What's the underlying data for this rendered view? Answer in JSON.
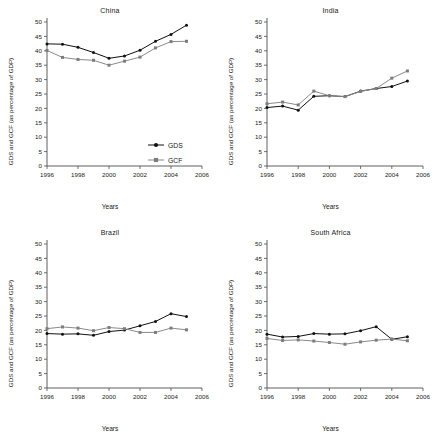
{
  "figure": {
    "axis_label_y": "GDS and GCF (as percentage of GDP)",
    "axis_label_x": "Years",
    "legend": {
      "gds": "GDS",
      "gcf": "GCF"
    },
    "colors": {
      "gds": "#111111",
      "gcf": "#8a8a8a",
      "axis": "#4d4d4d",
      "background": "#ffffff"
    }
  },
  "panels": {
    "china": {
      "title": "China"
    },
    "india": {
      "title": "India"
    },
    "brazil": {
      "title": "Brazil"
    },
    "south_africa": {
      "title": "South Africa"
    }
  },
  "chart_data": [
    {
      "type": "line",
      "title": "China",
      "xlabel": "Years",
      "ylabel": "GDS and GCF (as percentage of GDP)",
      "x": [
        1996,
        1997,
        1998,
        1999,
        2000,
        2001,
        2002,
        2003,
        2004,
        2005
      ],
      "xlim": [
        1996,
        2006
      ],
      "ylim": [
        0,
        50
      ],
      "xticks": [
        1996,
        1998,
        2000,
        2002,
        2004,
        2006
      ],
      "yticks": [
        0,
        5,
        10,
        15,
        20,
        25,
        30,
        35,
        40,
        45,
        50
      ],
      "grid": false,
      "legend_position": "center-right",
      "series": [
        {
          "name": "GDS",
          "values": [
            42.4,
            42.3,
            41.2,
            39.4,
            37.4,
            38.2,
            40.2,
            43.3,
            45.7,
            48.9
          ]
        },
        {
          "name": "GCF",
          "values": [
            40.1,
            37.7,
            37.0,
            36.7,
            35.0,
            36.4,
            37.8,
            41.0,
            43.2,
            43.3
          ]
        }
      ]
    },
    {
      "type": "line",
      "title": "India",
      "xlabel": "Years",
      "ylabel": "GDS and GCF (as percentage of GDP)",
      "x": [
        1996,
        1997,
        1998,
        1999,
        2000,
        2001,
        2002,
        2003,
        2004,
        2005
      ],
      "xlim": [
        1996,
        2006
      ],
      "ylim": [
        0,
        50
      ],
      "xticks": [
        1996,
        1998,
        2000,
        2002,
        2004,
        2006
      ],
      "yticks": [
        0,
        5,
        10,
        15,
        20,
        25,
        30,
        35,
        40,
        45,
        50
      ],
      "grid": false,
      "legend_position": "none",
      "series": [
        {
          "name": "GDS",
          "values": [
            20.3,
            20.8,
            19.4,
            24.2,
            24.4,
            24.1,
            26.0,
            26.9,
            27.6,
            29.5
          ]
        },
        {
          "name": "GCF",
          "values": [
            21.6,
            22.2,
            21.2,
            26.0,
            24.4,
            24.1,
            25.9,
            26.9,
            30.5,
            33.0
          ]
        }
      ]
    },
    {
      "type": "line",
      "title": "Brazil",
      "xlabel": "Years",
      "ylabel": "GDS and GCF (as percentage of GDP)",
      "x": [
        1996,
        1997,
        1998,
        1999,
        2000,
        2001,
        2002,
        2003,
        2004,
        2005
      ],
      "xlim": [
        1996,
        2006
      ],
      "ylim": [
        0,
        50
      ],
      "xticks": [
        1996,
        1998,
        2000,
        2002,
        2004,
        2006
      ],
      "yticks": [
        0,
        5,
        10,
        15,
        20,
        25,
        30,
        35,
        40,
        45,
        50
      ],
      "grid": false,
      "legend_position": "none",
      "series": [
        {
          "name": "GDS",
          "values": [
            18.9,
            18.7,
            18.8,
            18.3,
            19.6,
            20.1,
            21.6,
            23.1,
            25.8,
            24.8
          ]
        },
        {
          "name": "GCF",
          "values": [
            20.6,
            21.2,
            20.8,
            19.9,
            21.0,
            20.6,
            19.3,
            19.3,
            20.8,
            20.2
          ]
        }
      ]
    },
    {
      "type": "line",
      "title": "South Africa",
      "xlabel": "Years",
      "ylabel": "GDS and GCF (as percentage of GDP)",
      "x": [
        1996,
        1997,
        1998,
        1999,
        2000,
        2001,
        2002,
        2003,
        2004,
        2005
      ],
      "xlim": [
        1996,
        2006
      ],
      "ylim": [
        0,
        50
      ],
      "xticks": [
        1996,
        1998,
        2000,
        2002,
        2004,
        2006
      ],
      "yticks": [
        0,
        5,
        10,
        15,
        20,
        25,
        30,
        35,
        40,
        45,
        50
      ],
      "grid": false,
      "legend_position": "none",
      "series": [
        {
          "name": "GDS",
          "values": [
            18.7,
            17.7,
            17.9,
            18.9,
            18.7,
            18.8,
            19.9,
            21.3,
            16.9,
            17.8
          ]
        },
        {
          "name": "GCF",
          "values": [
            17.2,
            16.5,
            16.7,
            16.3,
            15.8,
            15.2,
            16.0,
            16.6,
            17.0,
            16.4
          ]
        }
      ]
    }
  ]
}
